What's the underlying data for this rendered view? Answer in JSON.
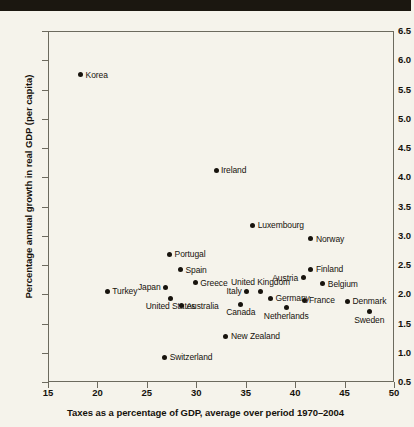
{
  "header_band": {
    "color": "#1b1710"
  },
  "chart_data": {
    "type": "scatter",
    "title": "",
    "xlabel": "Taxes as a percentage of GDP, average over period 1970–2004",
    "ylabel": "Percentage annual growth in real GDP (per capita)",
    "xlim": [
      15,
      50
    ],
    "ylim": [
      0.5,
      6.5
    ],
    "xticks": [
      15,
      20,
      25,
      30,
      35,
      40,
      45,
      50
    ],
    "yticks": [
      0.5,
      1.0,
      1.5,
      2.0,
      2.5,
      3.0,
      3.5,
      4.0,
      4.5,
      5.0,
      5.5,
      6.0,
      6.5
    ],
    "xticklabels": [
      "15",
      "20",
      "25",
      "30",
      "35",
      "40",
      "45",
      "50"
    ],
    "yticklabels": [
      "0.5",
      "1.0",
      "1.5",
      "2.0",
      "2.5",
      "3.0",
      "3.5",
      "4.0",
      "4.5",
      "5.0",
      "5.5",
      "6.0",
      "6.5"
    ],
    "grid": false,
    "legend": null,
    "marker_color": "#17130d",
    "points": [
      {
        "label": "Korea",
        "x": 18.3,
        "y": 5.75,
        "label_pos": "right"
      },
      {
        "label": "Ireland",
        "x": 32.0,
        "y": 4.12,
        "label_pos": "right"
      },
      {
        "label": "Luxembourg",
        "x": 35.7,
        "y": 3.18,
        "label_pos": "right"
      },
      {
        "label": "Norway",
        "x": 41.6,
        "y": 2.95,
        "label_pos": "right"
      },
      {
        "label": "Portugal",
        "x": 27.3,
        "y": 2.68,
        "label_pos": "right"
      },
      {
        "label": "Spain",
        "x": 28.4,
        "y": 2.42,
        "label_pos": "right"
      },
      {
        "label": "Finland",
        "x": 41.6,
        "y": 2.43,
        "label_pos": "right"
      },
      {
        "label": "Austria",
        "x": 40.8,
        "y": 2.28,
        "label_pos": "left"
      },
      {
        "label": "Greece",
        "x": 29.9,
        "y": 2.2,
        "label_pos": "right"
      },
      {
        "label": "Belgium",
        "x": 42.8,
        "y": 2.18,
        "label_pos": "right"
      },
      {
        "label": "Japan",
        "x": 26.9,
        "y": 2.12,
        "label_pos": "left"
      },
      {
        "label": "Italy",
        "x": 35.1,
        "y": 2.05,
        "label_pos": "left"
      },
      {
        "label": "United Kingdom",
        "x": 36.5,
        "y": 2.05,
        "label_pos": "above"
      },
      {
        "label": "Turkey",
        "x": 21.0,
        "y": 2.05,
        "label_pos": "right"
      },
      {
        "label": "United States",
        "x": 27.4,
        "y": 1.93,
        "label_pos": "below"
      },
      {
        "label": "Germany",
        "x": 37.5,
        "y": 1.93,
        "label_pos": "right"
      },
      {
        "label": "France",
        "x": 40.9,
        "y": 1.9,
        "label_pos": "right"
      },
      {
        "label": "Australia",
        "x": 28.5,
        "y": 1.8,
        "label_pos": "right"
      },
      {
        "label": "Canada",
        "x": 34.5,
        "y": 1.83,
        "label_pos": "below"
      },
      {
        "label": "Netherlands",
        "x": 39.1,
        "y": 1.77,
        "label_pos": "below"
      },
      {
        "label": "Denmark",
        "x": 45.3,
        "y": 1.88,
        "label_pos": "right"
      },
      {
        "label": "Sweden",
        "x": 47.5,
        "y": 1.7,
        "label_pos": "below"
      },
      {
        "label": "New Zealand",
        "x": 33.0,
        "y": 1.28,
        "label_pos": "right"
      },
      {
        "label": "Switzerland",
        "x": 26.8,
        "y": 0.92,
        "label_pos": "right"
      }
    ]
  }
}
